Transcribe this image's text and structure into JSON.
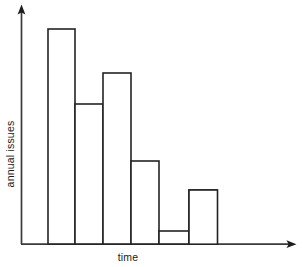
{
  "chart_data": {
    "type": "bar",
    "title": "",
    "subtitle": "",
    "xlabel": "time",
    "ylabel": "annual issues",
    "categories": [
      "1",
      "2",
      "3",
      "4",
      "5",
      "6",
      "7"
    ],
    "values": [
      100,
      110,
      71,
      87,
      42,
      6.7,
      27.5
    ],
    "bar_edges_px": [
      21,
      48,
      75,
      103,
      131,
      159,
      189,
      217
    ],
    "bar_tops_px": [
      48,
      29,
      104,
      73,
      161,
      231,
      190
    ],
    "baseline_px": 244,
    "axis_x_px": 21,
    "xlim": [
      0,
      1
    ],
    "ylim": [
      0,
      115
    ],
    "grid": false,
    "legend": null,
    "tick_labels_x": [],
    "tick_labels_y": [],
    "annotations": [],
    "style": {
      "bar_fill": "#ffffff",
      "bar_stroke": "#232323",
      "axis_color": "#3a3a3a",
      "background": "#ffffff",
      "stroke_width_px": 1.6
    },
    "axis_arrows": {
      "x_arrow_tip_px": 296,
      "y_arrow_tip_px": 5
    }
  }
}
